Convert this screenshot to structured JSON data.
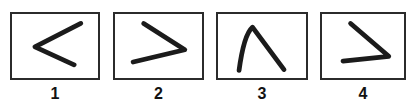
{
  "figure": {
    "type": "line-drawing-panel-set",
    "background_color": "#ffffff",
    "stroke_color": "#1b1b1b",
    "border_color": "#2b2b2b",
    "label_color": "#121212",
    "panel_count": 4
  },
  "panels": [
    {
      "label": "1",
      "glyph_name": "chevron-left-stroke",
      "description": "angle opening to the right, apex at left",
      "box": {
        "x": 10,
        "y": 12,
        "width": 90,
        "height": 68
      },
      "label_position": {
        "x": 10,
        "y": 85,
        "width": 90
      },
      "path": "M 72 10 L 24 35 L 65 54"
    },
    {
      "label": "2",
      "glyph_name": "chevron-right-stroke",
      "description": "angle opening to the left, apex at right",
      "box": {
        "x": 113,
        "y": 12,
        "width": 91,
        "height": 68
      },
      "label_position": {
        "x": 113,
        "y": 85,
        "width": 91
      },
      "path": "M 30 10 L 73 38 L 19 51"
    },
    {
      "label": "3",
      "glyph_name": "caret-up-stroke",
      "description": "inverted V with curved left leg, apex at top",
      "box": {
        "x": 216,
        "y": 12,
        "width": 92,
        "height": 68
      },
      "label_position": {
        "x": 216,
        "y": 85,
        "width": 92
      },
      "path": "M 22 60 Q 27 22 36 14 L 69 59"
    },
    {
      "label": "4",
      "glyph_name": "chevron-right-flat-stroke",
      "description": "angle opening to the left with flat lower arm, apex at right",
      "box": {
        "x": 320,
        "y": 12,
        "width": 86,
        "height": 68
      },
      "label_position": {
        "x": 320,
        "y": 85,
        "width": 86
      },
      "path": "M 30 10 L 70 45 L 22 50"
    }
  ]
}
